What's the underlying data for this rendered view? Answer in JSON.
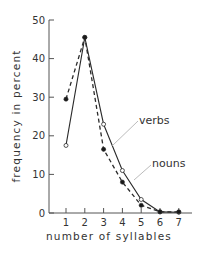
{
  "chart_data": {
    "type": "line",
    "title": "",
    "xlabel": "number of syllables",
    "ylabel": "frequency in percent",
    "x": [
      1,
      2,
      3,
      4,
      5,
      6,
      7
    ],
    "categories": [
      "1",
      "2",
      "3",
      "4",
      "5",
      "6",
      "7"
    ],
    "yticks": [
      "0",
      "10",
      "20",
      "30",
      "40",
      "50"
    ],
    "ylim": [
      0,
      50
    ],
    "grid": false,
    "legend": "inline labels with leader lines",
    "series": [
      {
        "name": "verbs",
        "style": "solid line, open circles",
        "values": [
          17.5,
          45.5,
          23,
          11,
          3.5,
          0.3,
          0.2
        ]
      },
      {
        "name": "nouns",
        "style": "dashed line, filled circles",
        "values": [
          29.5,
          45.5,
          16.5,
          8,
          2,
          0.3,
          0.3
        ]
      }
    ],
    "annotations": [
      {
        "text": "verbs",
        "points_to": "solid series"
      },
      {
        "text": "nouns",
        "points_to": "dashed series"
      }
    ]
  },
  "labels": {
    "xlabel": "number of syllables",
    "ylabel": "frequency in percent",
    "verbs": "verbs",
    "nouns": "nouns"
  }
}
